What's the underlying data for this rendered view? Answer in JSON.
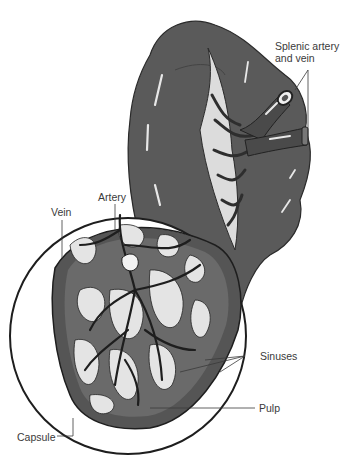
{
  "figure": {
    "labels": {
      "splenic_line1": "Splenic artery",
      "splenic_line2": "and vein",
      "artery": "Artery",
      "vein": "Vein",
      "sinuses": "Sinuses",
      "pulp": "Pulp",
      "capsule": "Capsule"
    },
    "colors": {
      "organ": "#5a5a5a",
      "organ_dark": "#3c3c3c",
      "highlight": "#e8e8e8",
      "stipple": "#d9d9d9",
      "outline": "#1e1e1e",
      "label_text": "#3a3a3a"
    }
  }
}
